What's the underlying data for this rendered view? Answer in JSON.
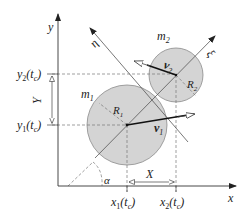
{
  "diagram": {
    "axes": {
      "x_label": "x",
      "y_label": "y",
      "xi_label": "ξ",
      "eta_label": "η",
      "angle_label": "α"
    },
    "bodies": [
      {
        "mass_label": "m",
        "mass_sub": "1",
        "radius_label": "R",
        "radius_sub": "1",
        "velocity_label": "v",
        "velocity_sub": "1"
      },
      {
        "mass_label": "m",
        "mass_sub": "2",
        "radius_label": "R",
        "radius_sub": "2",
        "velocity_label": "v",
        "velocity_sub": "2"
      }
    ],
    "coordinates": {
      "x1": {
        "main": "x",
        "sub": "1",
        "arg": "(t",
        "arg_sub": "c",
        "close": ")"
      },
      "x2": {
        "main": "x",
        "sub": "2",
        "arg": "(t",
        "arg_sub": "c",
        "close": ")"
      },
      "y1": {
        "main": "y",
        "sub": "1",
        "arg": "(t",
        "arg_sub": "c",
        "close": ")"
      },
      "y2": {
        "main": "y",
        "sub": "2",
        "arg": "(t",
        "arg_sub": "c",
        "close": ")"
      }
    },
    "distances": {
      "X": "X",
      "Y": "Y"
    },
    "colors": {
      "disc_fill": "#d4d4d4",
      "disc_stroke": "#8a8a8a",
      "line": "#333333",
      "dashed": "#777777"
    }
  }
}
